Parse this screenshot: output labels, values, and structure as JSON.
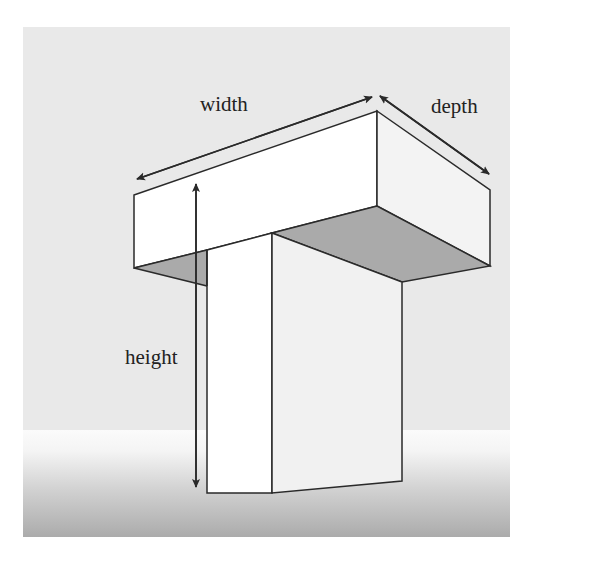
{
  "diagram": {
    "type": "3D T-shaped block dimension illustration",
    "labels": {
      "width": "width",
      "depth": "depth",
      "height": "height"
    },
    "colors": {
      "background_upper": "#e9e9e9",
      "background_lower_top": "#fbfbfb",
      "background_lower_bottom": "#ababab",
      "face_white": "#ffffff",
      "face_light": "#f1f1f1",
      "face_shaded": "#aaaaaa",
      "stroke": "#2a2a2a"
    }
  }
}
